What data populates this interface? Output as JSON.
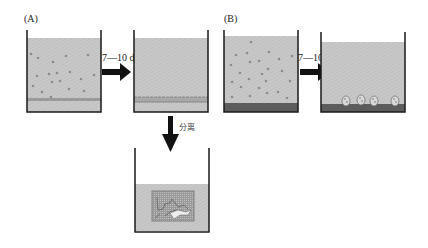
{
  "panels": {
    "a_label": "(A)",
    "b_label": "(B)"
  },
  "arrows": {
    "a_time": "7—10 d",
    "b_time": "7—10 d",
    "separate": "分离"
  },
  "colors": {
    "liquid": "#c4c4c4",
    "beaker_wall": "#1a1a1a",
    "sediment_dark": "#555555",
    "arrow": "#111111"
  }
}
